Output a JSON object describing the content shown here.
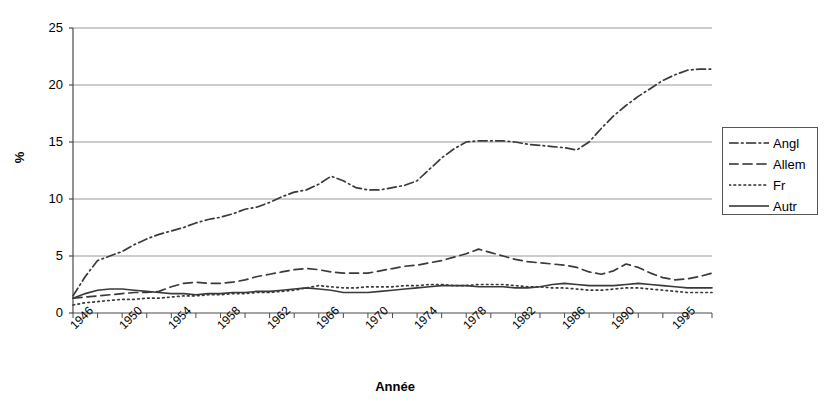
{
  "chart_data": {
    "type": "line",
    "title": "",
    "xlabel": "Année",
    "ylabel": "%",
    "xlim": [
      1946,
      1998
    ],
    "ylim": [
      0,
      25
    ],
    "grid": true,
    "gridlines_y": [
      0,
      5,
      10,
      15,
      20,
      25
    ],
    "legend_position": "right",
    "y_ticks": [
      "0",
      "5",
      "10",
      "15",
      "20",
      "25"
    ],
    "y_tick_values": [
      0,
      5,
      10,
      15,
      20,
      25
    ],
    "x_ticks": [
      "1946",
      "1950",
      "1954",
      "1958",
      "1962",
      "1966",
      "1970",
      "1974",
      "1978",
      "1982",
      "1986",
      "1990",
      "1995"
    ],
    "x_tick_values": [
      1946,
      1950,
      1954,
      1958,
      1962,
      1966,
      1970,
      1974,
      1978,
      1982,
      1986,
      1990,
      1995
    ],
    "x": [
      1946,
      1947,
      1948,
      1949,
      1950,
      1951,
      1952,
      1953,
      1954,
      1955,
      1956,
      1957,
      1958,
      1959,
      1960,
      1961,
      1962,
      1963,
      1964,
      1965,
      1966,
      1967,
      1968,
      1969,
      1970,
      1971,
      1972,
      1973,
      1974,
      1975,
      1976,
      1977,
      1978,
      1979,
      1980,
      1981,
      1982,
      1983,
      1984,
      1985,
      1986,
      1987,
      1988,
      1989,
      1990,
      1991,
      1992,
      1993,
      1994,
      1995,
      1996,
      1997,
      1998
    ],
    "series": [
      {
        "name": "Angl",
        "dash": "dash-dot",
        "color": "#3a3a3a",
        "values": [
          1.5,
          3.2,
          4.6,
          5.0,
          5.4,
          6.0,
          6.5,
          6.9,
          7.2,
          7.5,
          7.9,
          8.2,
          8.4,
          8.7,
          9.1,
          9.3,
          9.7,
          10.2,
          10.6,
          10.8,
          11.3,
          12.0,
          11.6,
          11.0,
          10.8,
          10.8,
          11.0,
          11.2,
          11.6,
          12.6,
          13.6,
          14.4,
          15.0,
          15.1,
          15.1,
          15.1,
          15.0,
          14.8,
          14.7,
          14.6,
          14.5,
          14.3,
          15.0,
          16.2,
          17.3,
          18.2,
          19.0,
          19.7,
          20.4,
          20.9,
          21.3,
          21.4,
          21.4
        ]
      },
      {
        "name": "Allem",
        "dash": "dashed",
        "color": "#3a3a3a",
        "values": [
          1.3,
          1.4,
          1.5,
          1.6,
          1.7,
          1.8,
          1.8,
          1.9,
          2.3,
          2.6,
          2.7,
          2.6,
          2.6,
          2.7,
          2.9,
          3.2,
          3.4,
          3.6,
          3.8,
          3.9,
          3.8,
          3.6,
          3.5,
          3.5,
          3.5,
          3.7,
          3.9,
          4.1,
          4.2,
          4.4,
          4.6,
          4.9,
          5.2,
          5.6,
          5.3,
          5.0,
          4.7,
          4.5,
          4.4,
          4.3,
          4.2,
          4.0,
          3.6,
          3.4,
          3.7,
          4.3,
          4.0,
          3.5,
          3.1,
          2.9,
          3.0,
          3.2,
          3.5
        ]
      },
      {
        "name": "Fr",
        "dash": "dotted",
        "color": "#3a3a3a",
        "values": [
          0.7,
          0.9,
          1.0,
          1.1,
          1.2,
          1.2,
          1.3,
          1.3,
          1.4,
          1.5,
          1.5,
          1.6,
          1.6,
          1.7,
          1.7,
          1.8,
          1.8,
          1.9,
          2.0,
          2.2,
          2.4,
          2.3,
          2.2,
          2.2,
          2.3,
          2.3,
          2.3,
          2.4,
          2.4,
          2.5,
          2.5,
          2.4,
          2.4,
          2.5,
          2.5,
          2.5,
          2.4,
          2.3,
          2.3,
          2.2,
          2.2,
          2.1,
          2.0,
          2.0,
          2.1,
          2.2,
          2.2,
          2.1,
          2.0,
          1.9,
          1.8,
          1.8,
          1.8
        ]
      },
      {
        "name": "Autr",
        "dash": "solid",
        "color": "#3a3a3a",
        "values": [
          1.3,
          1.7,
          2.0,
          2.1,
          2.1,
          2.0,
          1.9,
          1.8,
          1.7,
          1.7,
          1.6,
          1.7,
          1.7,
          1.8,
          1.8,
          1.9,
          1.9,
          2.0,
          2.1,
          2.2,
          2.1,
          2.0,
          1.8,
          1.8,
          1.8,
          1.9,
          2.0,
          2.1,
          2.2,
          2.3,
          2.4,
          2.4,
          2.4,
          2.3,
          2.3,
          2.3,
          2.2,
          2.2,
          2.3,
          2.5,
          2.6,
          2.5,
          2.4,
          2.4,
          2.4,
          2.5,
          2.6,
          2.5,
          2.4,
          2.3,
          2.2,
          2.2,
          2.2
        ]
      }
    ]
  },
  "legend": {
    "items": [
      {
        "label": "Angl",
        "dash": "dash-dot"
      },
      {
        "label": "Allem",
        "dash": "dashed"
      },
      {
        "label": "Fr",
        "dash": "dotted"
      },
      {
        "label": "Autr",
        "dash": "solid"
      }
    ]
  },
  "axes": {
    "y_title": "%",
    "x_title": "Année"
  }
}
